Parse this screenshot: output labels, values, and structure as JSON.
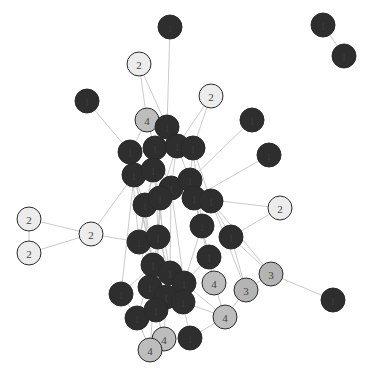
{
  "diagram": {
    "type": "network-graph",
    "colors": {
      "group1": "#2e2e2e",
      "group2": "#ececec",
      "group3": "#b4b4b4",
      "group4": "#bdbdbd",
      "edge": "#c4c4c4",
      "label_dark": "#555555",
      "label_light": "#444444"
    },
    "nodes": [
      {
        "id": "a1",
        "x": 170,
        "y": 27,
        "group": 1,
        "label": "1"
      },
      {
        "id": "a2",
        "x": 139,
        "y": 64,
        "group": 2,
        "label": "2"
      },
      {
        "id": "a3",
        "x": 87,
        "y": 101,
        "group": 1,
        "label": "1"
      },
      {
        "id": "a4",
        "x": 211,
        "y": 96,
        "group": 2,
        "label": "2"
      },
      {
        "id": "a5",
        "x": 147,
        "y": 120,
        "group": 4,
        "label": "4"
      },
      {
        "id": "a6",
        "x": 167,
        "y": 127,
        "group": 1,
        "label": "1"
      },
      {
        "id": "a7",
        "x": 252,
        "y": 120,
        "group": 1,
        "label": "1"
      },
      {
        "id": "a8",
        "x": 269,
        "y": 155,
        "group": 1,
        "label": "1"
      },
      {
        "id": "a9",
        "x": 130,
        "y": 152,
        "group": 1,
        "label": "1"
      },
      {
        "id": "a10",
        "x": 155,
        "y": 148,
        "group": 1,
        "label": "1"
      },
      {
        "id": "a11",
        "x": 177,
        "y": 146,
        "group": 1,
        "label": "1"
      },
      {
        "id": "a12",
        "x": 193,
        "y": 148,
        "group": 1,
        "label": "1"
      },
      {
        "id": "a13",
        "x": 134,
        "y": 175,
        "group": 1,
        "label": "1"
      },
      {
        "id": "a14",
        "x": 153,
        "y": 170,
        "group": 1,
        "label": "1"
      },
      {
        "id": "a15",
        "x": 171,
        "y": 188,
        "group": 1,
        "label": "1"
      },
      {
        "id": "a16",
        "x": 190,
        "y": 180,
        "group": 1,
        "label": "1"
      },
      {
        "id": "a17",
        "x": 145,
        "y": 205,
        "group": 1,
        "label": "1"
      },
      {
        "id": "a18",
        "x": 160,
        "y": 198,
        "group": 1,
        "label": "1"
      },
      {
        "id": "a19",
        "x": 194,
        "y": 198,
        "group": 1,
        "label": "1"
      },
      {
        "id": "a20",
        "x": 211,
        "y": 201,
        "group": 1,
        "label": "1"
      },
      {
        "id": "a21",
        "x": 280,
        "y": 208,
        "group": 2,
        "label": "2"
      },
      {
        "id": "a22",
        "x": 29,
        "y": 219,
        "group": 2,
        "label": "2"
      },
      {
        "id": "a23",
        "x": 91,
        "y": 234,
        "group": 2,
        "label": "2"
      },
      {
        "id": "a24",
        "x": 29,
        "y": 253,
        "group": 2,
        "label": "2"
      },
      {
        "id": "a25",
        "x": 202,
        "y": 226,
        "group": 1,
        "label": "1"
      },
      {
        "id": "a26",
        "x": 231,
        "y": 237,
        "group": 1,
        "label": "1"
      },
      {
        "id": "a27",
        "x": 139,
        "y": 242,
        "group": 1,
        "label": "1"
      },
      {
        "id": "a28",
        "x": 158,
        "y": 237,
        "group": 1,
        "label": "1"
      },
      {
        "id": "a29",
        "x": 209,
        "y": 257,
        "group": 1,
        "label": "1"
      },
      {
        "id": "a30",
        "x": 271,
        "y": 274,
        "group": 3,
        "label": "3"
      },
      {
        "id": "a31",
        "x": 153,
        "y": 265,
        "group": 1,
        "label": "1"
      },
      {
        "id": "a32",
        "x": 170,
        "y": 273,
        "group": 1,
        "label": "1"
      },
      {
        "id": "a33",
        "x": 184,
        "y": 283,
        "group": 1,
        "label": "1"
      },
      {
        "id": "a34",
        "x": 214,
        "y": 283,
        "group": 4,
        "label": "4"
      },
      {
        "id": "a35",
        "x": 246,
        "y": 290,
        "group": 3,
        "label": "3"
      },
      {
        "id": "a36",
        "x": 121,
        "y": 294,
        "group": 1,
        "label": "1"
      },
      {
        "id": "a37",
        "x": 150,
        "y": 287,
        "group": 1,
        "label": "1"
      },
      {
        "id": "a38",
        "x": 166,
        "y": 297,
        "group": 1,
        "label": "1"
      },
      {
        "id": "a39",
        "x": 183,
        "y": 302,
        "group": 1,
        "label": "1"
      },
      {
        "id": "a40",
        "x": 333,
        "y": 300,
        "group": 1,
        "label": "1"
      },
      {
        "id": "a41",
        "x": 137,
        "y": 318,
        "group": 1,
        "label": "1"
      },
      {
        "id": "a42",
        "x": 156,
        "y": 310,
        "group": 1,
        "label": "1"
      },
      {
        "id": "a43",
        "x": 225,
        "y": 317,
        "group": 4,
        "label": "4"
      },
      {
        "id": "a44",
        "x": 164,
        "y": 339,
        "group": 4,
        "label": "4"
      },
      {
        "id": "a45",
        "x": 190,
        "y": 338,
        "group": 1,
        "label": "1"
      },
      {
        "id": "a46",
        "x": 150,
        "y": 350,
        "group": 4,
        "label": "4"
      },
      {
        "id": "a47",
        "x": 323,
        "y": 25,
        "group": 1,
        "label": "1"
      },
      {
        "id": "a48",
        "x": 344,
        "y": 56,
        "group": 1,
        "label": "1"
      }
    ],
    "edges": [
      [
        "a1",
        "a6"
      ],
      [
        "a2",
        "a5"
      ],
      [
        "a2",
        "a6"
      ],
      [
        "a3",
        "a9"
      ],
      [
        "a4",
        "a11"
      ],
      [
        "a4",
        "a12"
      ],
      [
        "a5",
        "a9"
      ],
      [
        "a5",
        "a10"
      ],
      [
        "a5",
        "a6"
      ],
      [
        "a7",
        "a16"
      ],
      [
        "a8",
        "a19"
      ],
      [
        "a6",
        "a14"
      ],
      [
        "a6",
        "a17"
      ],
      [
        "a9",
        "a13"
      ],
      [
        "a10",
        "a14"
      ],
      [
        "a11",
        "a15"
      ],
      [
        "a12",
        "a16"
      ],
      [
        "a13",
        "a17"
      ],
      [
        "a14",
        "a18"
      ],
      [
        "a15",
        "a19"
      ],
      [
        "a16",
        "a20"
      ],
      [
        "a17",
        "a27"
      ],
      [
        "a18",
        "a28"
      ],
      [
        "a19",
        "a25"
      ],
      [
        "a20",
        "a26"
      ],
      [
        "a19",
        "a21"
      ],
      [
        "a26",
        "a21"
      ],
      [
        "a22",
        "a24"
      ],
      [
        "a22",
        "a23"
      ],
      [
        "a24",
        "a23"
      ],
      [
        "a23",
        "a13"
      ],
      [
        "a23",
        "a27"
      ],
      [
        "a26",
        "a30"
      ],
      [
        "a30",
        "a40"
      ],
      [
        "a30",
        "a35"
      ],
      [
        "a35",
        "a43"
      ],
      [
        "a29",
        "a34"
      ],
      [
        "a34",
        "a43"
      ],
      [
        "a43",
        "a33"
      ],
      [
        "a43",
        "a39"
      ],
      [
        "a25",
        "a29"
      ],
      [
        "a27",
        "a31"
      ],
      [
        "a28",
        "a32"
      ],
      [
        "a31",
        "a37"
      ],
      [
        "a32",
        "a38"
      ],
      [
        "a33",
        "a39"
      ],
      [
        "a36",
        "a41"
      ],
      [
        "a37",
        "a42"
      ],
      [
        "a38",
        "a44"
      ],
      [
        "a41",
        "a46"
      ],
      [
        "a42",
        "a44"
      ],
      [
        "a44",
        "a46"
      ],
      [
        "a45",
        "a39"
      ],
      [
        "a45",
        "a43"
      ],
      [
        "a36",
        "a31"
      ],
      [
        "a9",
        "a27"
      ],
      [
        "a10",
        "a28"
      ],
      [
        "a11",
        "a18"
      ],
      [
        "a12",
        "a20"
      ],
      [
        "a13",
        "a31"
      ],
      [
        "a14",
        "a32"
      ],
      [
        "a15",
        "a33"
      ],
      [
        "a16",
        "a29"
      ],
      [
        "a17",
        "a37"
      ],
      [
        "a18",
        "a38"
      ],
      [
        "a19",
        "a34"
      ],
      [
        "a20",
        "a35"
      ],
      [
        "a25",
        "a33"
      ],
      [
        "a27",
        "a42"
      ],
      [
        "a28",
        "a37"
      ],
      [
        "a6",
        "a10"
      ],
      [
        "a6",
        "a11"
      ],
      [
        "a10",
        "a15"
      ],
      [
        "a14",
        "a27"
      ],
      [
        "a17",
        "a31"
      ],
      [
        "a29",
        "a33"
      ],
      [
        "a9",
        "a31"
      ],
      [
        "a15",
        "a32"
      ],
      [
        "a16",
        "a25"
      ],
      [
        "a47",
        "a48"
      ],
      [
        "a11",
        "a16"
      ],
      [
        "a12",
        "a25"
      ],
      [
        "a13",
        "a36"
      ],
      [
        "a18",
        "a42"
      ],
      [
        "a28",
        "a46"
      ],
      [
        "a20",
        "a30"
      ],
      [
        "a26",
        "a35"
      ],
      [
        "a31",
        "a41"
      ]
    ]
  }
}
